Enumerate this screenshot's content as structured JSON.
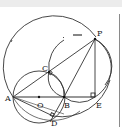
{
  "diagram": {
    "type": "geometry",
    "points": {
      "A": {
        "label": "A",
        "x": 13,
        "y": 97
      },
      "O": {
        "label": "O",
        "x": 39,
        "y": 97
      },
      "B": {
        "label": "B",
        "x": 64,
        "y": 97
      },
      "E": {
        "label": "E",
        "x": 95,
        "y": 97
      },
      "C": {
        "label": "C",
        "x": 49,
        "y": 72
      },
      "P": {
        "label": "P",
        "x": 95,
        "y": 39
      },
      "D": {
        "label": "D",
        "x": 53,
        "y": 116
      }
    },
    "segments": [
      "AB",
      "BE",
      "AP",
      "PE",
      "PB",
      "AD",
      "CB",
      "CD"
    ],
    "circles": [
      "circle O (diameter AB)",
      "large circle through A and P",
      "arcs through C, P, B, E"
    ],
    "right_angle_marks": [
      "E",
      "C",
      "D"
    ],
    "colors": {
      "stroke": "#333333",
      "background": "#ffffff",
      "topbar": "#ececec"
    }
  }
}
